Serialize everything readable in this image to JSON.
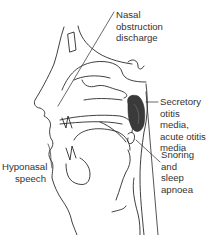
{
  "diagram": {
    "colors": {
      "line": "#2a2a2a",
      "adenoid_fill": "#3a3a3a",
      "text": "#333333",
      "background": "#ffffff"
    },
    "labels": [
      {
        "id": "nasal",
        "text": "Nasal\nobstruction\ndischarge"
      },
      {
        "id": "otitis",
        "text": "Secretory\notitis media,\nacute otitis\nmedia"
      },
      {
        "id": "snoring",
        "text": "Snoring and\nsleep\napnoea"
      },
      {
        "id": "hyponasal",
        "text": "Hyponasal\nspeech"
      }
    ]
  }
}
